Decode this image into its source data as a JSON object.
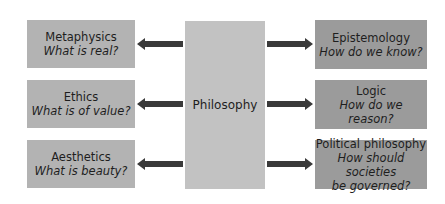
{
  "center": {
    "label": "Philosophy"
  },
  "branches_left": [
    {
      "title": "Metaphysics",
      "question": "What is real?"
    },
    {
      "title": "Ethics",
      "question": "What is of value?"
    },
    {
      "title": "Aesthetics",
      "question": "What is beauty?"
    }
  ],
  "branches_right": [
    {
      "title": "Epistemology",
      "question": "How do we know?"
    },
    {
      "title": "Logic",
      "question": "How do we reason?"
    },
    {
      "title": "Political philosophy",
      "question_line1": "How should societies",
      "question_line2": "be governed?"
    }
  ],
  "colors": {
    "left_box": "#b3b3b3",
    "center_box": "#c2c2c2",
    "right_box": "#9b9b9b",
    "arrow": "#3a3a3a"
  }
}
